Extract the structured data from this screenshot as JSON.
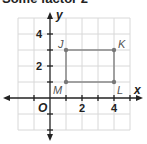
{
  "caption": "Some factor 2",
  "axes": {
    "x_label": "x",
    "y_label": "y",
    "origin_label": "O"
  },
  "x_ticks": [
    {
      "value": 2,
      "label": "2"
    },
    {
      "value": 4,
      "label": "4"
    }
  ],
  "y_ticks": [
    {
      "value": 2,
      "label": "2"
    },
    {
      "value": 4,
      "label": "4"
    }
  ],
  "points": [
    {
      "name": "J",
      "x": 1,
      "y": 3
    },
    {
      "name": "K",
      "x": 4,
      "y": 3
    },
    {
      "name": "L",
      "x": 4,
      "y": 1
    },
    {
      "name": "M",
      "x": 1,
      "y": 1
    }
  ],
  "colors": {
    "grid": "#d8d8d8",
    "axis": "#222222",
    "rectangle": "#888888",
    "point": "#777777"
  }
}
